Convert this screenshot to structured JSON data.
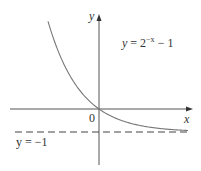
{
  "diagram": {
    "type": "function-graph",
    "function_label": {
      "prefix": "y = 2",
      "exponent": "−x",
      "suffix": " − 1"
    },
    "asymptote_label": "y = −1",
    "origin_label": "0",
    "x_axis_label": "x",
    "y_axis_label": "y",
    "colors": {
      "curve": "#777777",
      "axes": "#555555",
      "text": "#333333"
    }
  },
  "chart_data": {
    "type": "line",
    "xlabel": "x",
    "ylabel": "y",
    "series": [
      {
        "name": "y = 2^(-x) - 1",
        "x": [
          -2.3,
          -2,
          -1.5,
          -1,
          -0.5,
          0,
          0.5,
          1,
          2,
          3,
          4
        ],
        "y": [
          3.92,
          3,
          1.83,
          1,
          0.41,
          0,
          -0.29,
          -0.5,
          -0.75,
          -0.875,
          -0.94
        ]
      }
    ],
    "annotations": [
      "y = 2^(-x) - 1",
      "y = -1 (horizontal asymptote, dashed)",
      "0 (origin)"
    ],
    "grid": false
  }
}
